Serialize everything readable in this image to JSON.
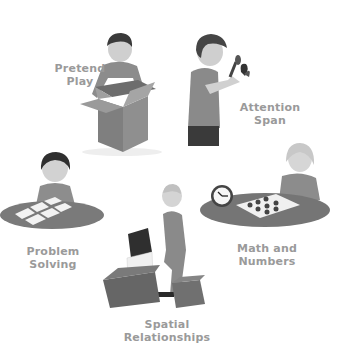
{
  "diagram": {
    "type": "activity-wheel",
    "style": "grayscale illustration",
    "nodes": [
      {
        "id": "pretend-play",
        "lines": [
          "Pretend",
          "Play"
        ],
        "figure": "toddler boy standing inside an open cardboard box"
      },
      {
        "id": "attention-span",
        "lines": [
          "Attention",
          "Span"
        ],
        "figure": "boy looking at a butterfly through a magnifying glass"
      },
      {
        "id": "math-and-numbers",
        "lines": [
          "Math and",
          "Numbers"
        ],
        "figure": "girl at round table with a clock and a counting board"
      },
      {
        "id": "spatial-relationships",
        "lines": [
          "Spatial",
          "Relationships"
        ],
        "figure": "toddler stacking large foam blocks"
      },
      {
        "id": "problem-solving",
        "lines": [
          "Problem",
          "Solving"
        ],
        "figure": "girl at round table with picture matching cards"
      }
    ]
  },
  "colors": {
    "label": "#9a9a9a",
    "background": "#ffffff",
    "table": "#7a7a7a",
    "box": "#8a8a8a",
    "dark_block": "#2e2e2e"
  }
}
